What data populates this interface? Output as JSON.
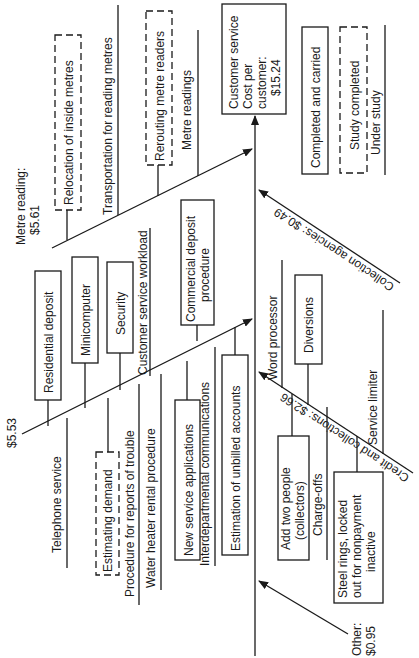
{
  "diagram": {
    "type": "cause-and-effect (fishbone)",
    "effect": {
      "lines": [
        "Customer service",
        "Cost per",
        "customer:",
        "$15.24"
      ]
    },
    "legend": [
      {
        "style": "solid-box",
        "label": "Completed and carried"
      },
      {
        "style": "dashed-box",
        "label": "Study completed"
      },
      {
        "style": "line",
        "label": "Under study"
      }
    ],
    "branches": {
      "metre_reading": {
        "label_lines": [
          "Metre reading:",
          "$5.61"
        ],
        "items": [
          {
            "style": "dashed-box",
            "label": "Relocation of inside metres"
          },
          {
            "style": "line",
            "label": "Transportation for reading metres"
          },
          {
            "style": "dashed-box",
            "label": "Rerouting metre readers"
          },
          {
            "style": "line",
            "label": "Metre readings"
          }
        ]
      },
      "customer_service": {
        "label": "$5.53",
        "items_above": [
          {
            "style": "solid-box",
            "label": "Residential deposit"
          },
          {
            "style": "solid-box",
            "label": "Minicomputer"
          },
          {
            "style": "solid-box",
            "label": "Security"
          },
          {
            "style": "line",
            "label": "Customer service workload"
          },
          {
            "style": "solid-box",
            "label_lines": [
              "Commercial deposit",
              "procedure"
            ]
          }
        ],
        "items_below": [
          {
            "style": "line",
            "label": "Telephone service"
          },
          {
            "style": "dashed-box",
            "label": "Estimating demand"
          },
          {
            "style": "line",
            "label": "Procedure for reports of trouble"
          },
          {
            "style": "line",
            "label": "Water heater rental procedure"
          },
          {
            "style": "solid-box",
            "label": "New service applications"
          },
          {
            "style": "line",
            "label": "Interdepartmental communications"
          },
          {
            "style": "solid-box",
            "label": "Estimation of unbilled accounts"
          }
        ]
      },
      "collection_agencies": {
        "label": "Collection agencies: $0.49"
      },
      "credit_and_collections": {
        "label": "Credit and collections: $2.66",
        "items_above": [
          {
            "style": "line",
            "label": "Word processor"
          },
          {
            "style": "solid-box",
            "label": "Diversions"
          },
          {
            "style": "line",
            "label": "Service limiter"
          }
        ],
        "items_below": [
          {
            "style": "solid-box",
            "label_lines": [
              "Add two people",
              "(collectors)"
            ]
          },
          {
            "style": "line",
            "label": "Charge-offs"
          },
          {
            "style": "solid-box",
            "label_lines": [
              "Steel rings, locked",
              "out for nonpayment",
              "inactive"
            ]
          }
        ]
      },
      "other": {
        "label_lines": [
          "Other:",
          "$0.95"
        ]
      }
    }
  }
}
